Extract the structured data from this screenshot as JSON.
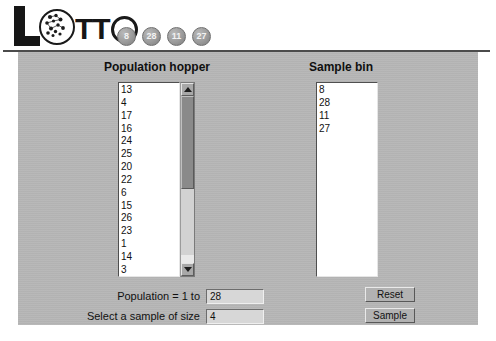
{
  "app": {
    "logo_text_left": "L",
    "logo_text_mid": "TT",
    "logo_name": "Lotto"
  },
  "drawn_balls": [
    "8",
    "28",
    "11",
    "27"
  ],
  "columns": {
    "hopper_title": "Population hopper",
    "sample_title": "Sample bin"
  },
  "hopper": {
    "items": [
      "13",
      "4",
      "17",
      "16",
      "24",
      "25",
      "20",
      "22",
      "6",
      "15",
      "26",
      "23",
      "1",
      "14",
      "3"
    ]
  },
  "sample_bin": {
    "items": [
      "8",
      "28",
      "11",
      "27"
    ]
  },
  "form": {
    "population_label": "Population = 1 to",
    "population_value": "28",
    "sample_size_label": "Select a sample of size",
    "sample_size_value": "4"
  },
  "buttons": {
    "reset": "Reset",
    "sample": "Sample"
  },
  "colors": {
    "panel": "#b6b6b6",
    "ball": "#9b9b9b",
    "text": "#111111",
    "listbox_bg": "#ffffff",
    "scrollbar_thumb": "#8a8a8a"
  }
}
